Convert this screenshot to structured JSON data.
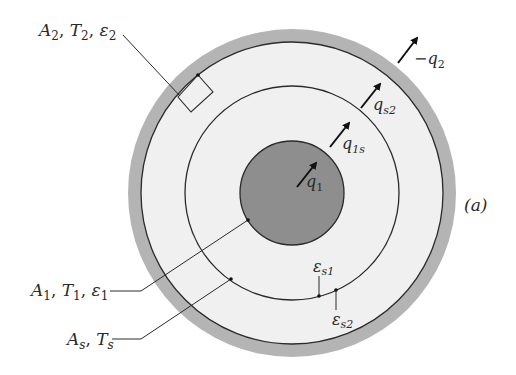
{
  "diagram": {
    "panel_label": "(a)",
    "colors": {
      "outer_shell": "#b4b4b4",
      "gap_fill": "#efefef",
      "core_fill": "#8e8e8e",
      "line": "#2a2a2a"
    },
    "labels": {
      "outer": {
        "A": "A",
        "A_sub": "2",
        "T": "T",
        "T_sub": "2",
        "eps": "ε",
        "eps_sub": "2"
      },
      "inner": {
        "A": "A",
        "A_sub": "1",
        "T": "T",
        "T_sub": "1",
        "eps": "ε",
        "eps_sub": "1"
      },
      "shield": {
        "A": "A",
        "A_sub": "s",
        "T": "T",
        "T_sub": "s"
      },
      "eps_s1": {
        "sym": "ε",
        "sub": "s1"
      },
      "eps_s2": {
        "sym": "ε",
        "sub": "s2"
      }
    },
    "fluxes": {
      "q1": {
        "sym": "q",
        "sub": "1"
      },
      "q1s": {
        "sym": "q",
        "sub": "1s"
      },
      "qs2": {
        "sym": "q",
        "sub": "s2"
      },
      "minus_q2": {
        "sym": "−q",
        "sub": "2"
      }
    }
  }
}
